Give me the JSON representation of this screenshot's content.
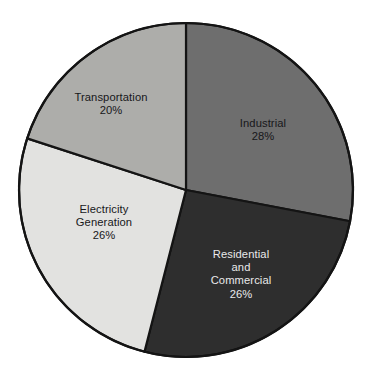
{
  "chart_data": {
    "type": "pie",
    "title": "",
    "subtitle": "",
    "xlabel": "",
    "ylabel": "",
    "legend_position": "none",
    "grid": false,
    "start_angle_deg": 0,
    "direction": "clockwise",
    "units": "percent",
    "categories": [
      "Industrial",
      "Residential and Commercial",
      "Electricity Generation",
      "Transportation"
    ],
    "values": [
      28,
      26,
      26,
      20
    ],
    "labels": [
      "28%",
      "26%",
      "26%",
      "20%"
    ],
    "colors": [
      "#6e6e6e",
      "#2e2e2e",
      "#e2e2e0",
      "#adadaa"
    ],
    "slices": [
      {
        "id": "industrial",
        "name": "Industrial",
        "value": 28,
        "value_label": "28%",
        "color": "#6e6e6e",
        "label_lines": [
          "Industrial"
        ],
        "label_text_color": "#17171a",
        "start_deg": 0,
        "end_deg": 100.8
      },
      {
        "id": "residential-commercial",
        "name": "Residential and Commercial",
        "value": 26,
        "value_label": "26%",
        "color": "#2e2e2e",
        "label_lines": [
          "Residential",
          "and",
          "Commercial"
        ],
        "label_text_color": "#e9e9ea",
        "start_deg": 100.8,
        "end_deg": 194.4
      },
      {
        "id": "electricity-generation",
        "name": "Electricity Generation",
        "value": 26,
        "value_label": "26%",
        "color": "#e2e2e0",
        "label_lines": [
          "Electricity",
          "Generation"
        ],
        "label_text_color": "#17171a",
        "start_deg": 194.4,
        "end_deg": 288.0
      },
      {
        "id": "transportation",
        "name": "Transportation",
        "value": 20,
        "value_label": "20%",
        "color": "#adadaa",
        "label_lines": [
          "Transportation"
        ],
        "label_text_color": "#17171a",
        "start_deg": 288.0,
        "end_deg": 360.0
      }
    ],
    "geometry": {
      "center_x": 186,
      "center_y": 190,
      "radius": 167,
      "stroke_color": "#141414",
      "background": "#ffffff"
    }
  },
  "labels": {
    "transportation": {
      "line1": "Transportation",
      "value": "20%"
    },
    "industrial": {
      "line1": "Industrial",
      "value": "28%"
    },
    "electricity": {
      "line1": "Electricity",
      "line2": "Generation",
      "value": "26%"
    },
    "residential": {
      "line1": "Residential",
      "line2": "and",
      "line3": "Commercial",
      "value": "26%"
    }
  }
}
